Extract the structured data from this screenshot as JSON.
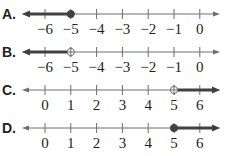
{
  "colors": {
    "axis": "#6d6e71",
    "ray": "#414042",
    "text": "#231f20",
    "point_fill": "#414042",
    "open_point_fill": "#ffffff"
  },
  "layout": {
    "axis_left": 22,
    "axis_right": 220,
    "first_tick_x": 45,
    "tick_spacing": 25.8,
    "rows_y": [
      14,
      52,
      90,
      128
    ],
    "label_dy": 16,
    "option_label_x": 2
  },
  "options": [
    {
      "letter": "A.",
      "ticks": [
        "−6",
        "−5",
        "−4",
        "−3",
        "−2",
        "−1",
        "0"
      ],
      "tick_values": [
        -6,
        -5,
        -4,
        -3,
        -2,
        -1,
        0
      ],
      "point": -5,
      "point_type": "closed",
      "ray_direction": "left"
    },
    {
      "letter": "B.",
      "ticks": [
        "−6",
        "−5",
        "−4",
        "−3",
        "−2",
        "−1",
        "0"
      ],
      "tick_values": [
        -6,
        -5,
        -4,
        -3,
        -2,
        -1,
        0
      ],
      "point": -5,
      "point_type": "open",
      "ray_direction": "left"
    },
    {
      "letter": "C.",
      "ticks": [
        "0",
        "1",
        "2",
        "3",
        "4",
        "5",
        "6"
      ],
      "tick_values": [
        0,
        1,
        2,
        3,
        4,
        5,
        6
      ],
      "point": 5,
      "point_type": "open",
      "ray_direction": "right"
    },
    {
      "letter": "D.",
      "ticks": [
        "0",
        "1",
        "2",
        "3",
        "4",
        "5",
        "6"
      ],
      "tick_values": [
        0,
        1,
        2,
        3,
        4,
        5,
        6
      ],
      "point": 5,
      "point_type": "closed",
      "ray_direction": "right"
    }
  ]
}
